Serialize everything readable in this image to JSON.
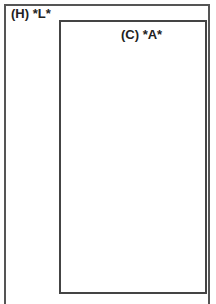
{
  "outer_region": {
    "label": "(H) *L*"
  },
  "inner_region": {
    "label": "(C) *A*"
  }
}
